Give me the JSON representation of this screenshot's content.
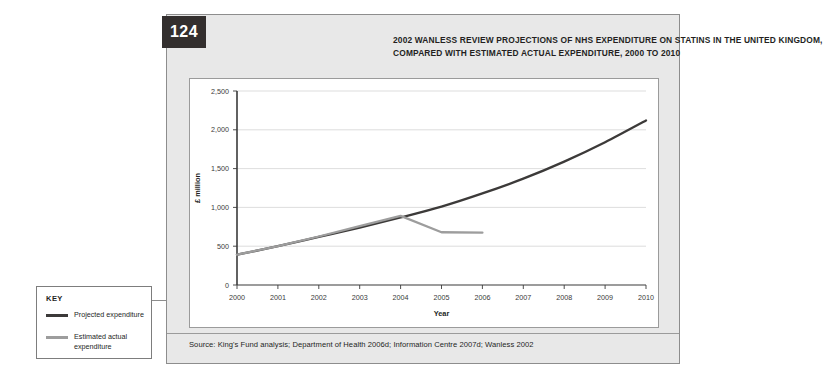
{
  "figure": {
    "number": "124",
    "title": "2002 Wanless review projections of NHS expenditure on statins in the United Kingdom, compared with estimated actual expenditure, 2000 to 2010",
    "source": "Source: King's Fund analysis; Department of Health 2006d; Information Centre 2007d; Wanless 2002"
  },
  "key": {
    "heading": "KEY",
    "entries": [
      {
        "label": "Projected expenditure",
        "color": "#3c3a39"
      },
      {
        "label": "Estimated actual expenditure",
        "color": "#9d9d9d"
      }
    ]
  },
  "colors": {
    "projected": "#3c3a39",
    "estimated_actual": "#9d9d9d",
    "axis": "#3a3a3a",
    "gridline": "#d4d4d4",
    "panel_background": "#e8e8e8",
    "badge_background": "#332f2e"
  },
  "chart_data": {
    "type": "line",
    "title": "2002 Wanless review projections of NHS expenditure on statins in the United Kingdom, compared with estimated actual expenditure, 2000 to 2010",
    "xlabel": "Year",
    "ylabel": "£ million",
    "x": [
      2000,
      2001,
      2002,
      2003,
      2004,
      2005,
      2006,
      2007,
      2008,
      2009,
      2010
    ],
    "xlim": [
      2000,
      2010
    ],
    "ylim": [
      0,
      2500
    ],
    "ytick_labels": [
      "0",
      "500",
      "1,000",
      "1,500",
      "2,000",
      "2,500"
    ],
    "yticks": [
      0,
      500,
      1000,
      1500,
      2000,
      2500
    ],
    "xtick_labels": [
      "2000",
      "2001",
      "2002",
      "2003",
      "2004",
      "2005",
      "2006",
      "2007",
      "2008",
      "2009",
      "2010"
    ],
    "grid": "horizontal",
    "legend_position": "external-key-box",
    "series": [
      {
        "name": "Projected expenditure",
        "color": "#3c3a39",
        "x": [
          2000,
          2001,
          2002,
          2003,
          2004,
          2005,
          2006,
          2007,
          2008,
          2009,
          2010
        ],
        "values": [
          390,
          500,
          620,
          740,
          870,
          1010,
          1180,
          1370,
          1590,
          1840,
          2120
        ]
      },
      {
        "name": "Estimated actual expenditure",
        "color": "#9d9d9d",
        "x": [
          2000,
          2001,
          2002,
          2003,
          2004,
          2005,
          2006
        ],
        "values": [
          390,
          500,
          625,
          760,
          890,
          680,
          675
        ]
      }
    ]
  }
}
